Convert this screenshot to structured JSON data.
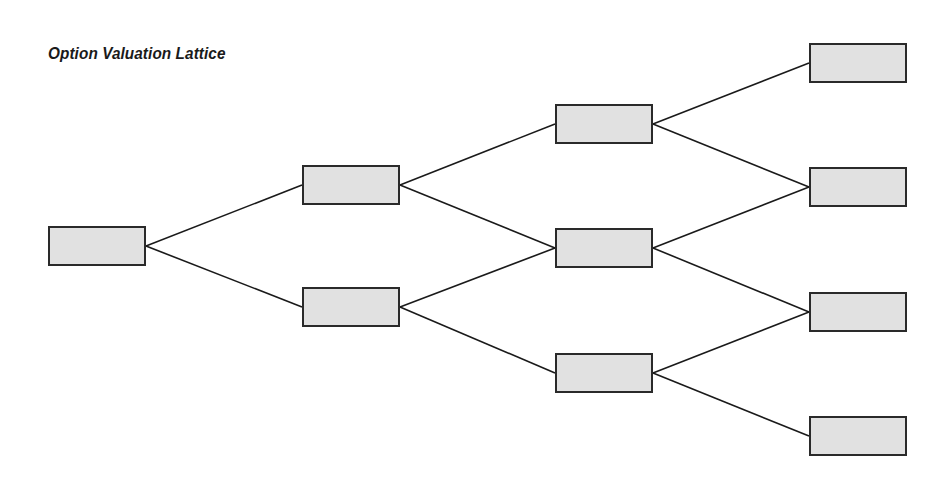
{
  "title": "Option Valuation Lattice",
  "colors": {
    "node_fill": "#e1e1e1",
    "node_border": "#2a2a2a",
    "edge": "#1a1a1a",
    "background": "#ffffff"
  },
  "lattice": {
    "levels": 4,
    "node_size": {
      "width": 98,
      "height": 40
    },
    "nodes": [
      {
        "id": "n0",
        "level": 0,
        "label": "",
        "x": 48,
        "y": 226
      },
      {
        "id": "n1u",
        "level": 1,
        "label": "",
        "x": 302,
        "y": 165
      },
      {
        "id": "n1d",
        "level": 1,
        "label": "",
        "x": 302,
        "y": 287
      },
      {
        "id": "n2u",
        "level": 2,
        "label": "",
        "x": 555,
        "y": 104
      },
      {
        "id": "n2m",
        "level": 2,
        "label": "",
        "x": 555,
        "y": 228
      },
      {
        "id": "n2d",
        "level": 2,
        "label": "",
        "x": 555,
        "y": 353
      },
      {
        "id": "n3a",
        "level": 3,
        "label": "",
        "x": 809,
        "y": 43
      },
      {
        "id": "n3b",
        "level": 3,
        "label": "",
        "x": 809,
        "y": 167
      },
      {
        "id": "n3c",
        "level": 3,
        "label": "",
        "x": 809,
        "y": 292
      },
      {
        "id": "n3d",
        "level": 3,
        "label": "",
        "x": 809,
        "y": 416
      }
    ],
    "edges": [
      [
        "n0",
        "n1u"
      ],
      [
        "n0",
        "n1d"
      ],
      [
        "n1u",
        "n2u"
      ],
      [
        "n1u",
        "n2m"
      ],
      [
        "n1d",
        "n2m"
      ],
      [
        "n1d",
        "n2d"
      ],
      [
        "n2u",
        "n3a"
      ],
      [
        "n2u",
        "n3b"
      ],
      [
        "n2m",
        "n3b"
      ],
      [
        "n2m",
        "n3c"
      ],
      [
        "n2d",
        "n3c"
      ],
      [
        "n2d",
        "n3d"
      ]
    ]
  }
}
